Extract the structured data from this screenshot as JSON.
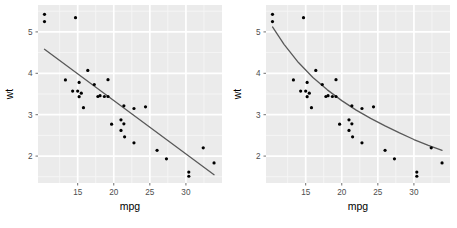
{
  "figure": {
    "type": "scatterplot-pair",
    "background_color": "#ffffff",
    "panel_background_color": "#ebebeb",
    "major_gridline_color": "#ffffff",
    "minor_gridline_color": "#f5f5f5",
    "point_color": "#000000",
    "fit_line_color": "#595959",
    "tick_text_color": "#4d4d4d",
    "axis_title_color": "#000000"
  },
  "panels": [
    {
      "name": "left-panel",
      "fit_type": "linear",
      "axis": {
        "xlabel": "mpg",
        "ylabel": "wt",
        "x_ticks": [
          "15",
          "20",
          "25",
          "30"
        ],
        "y_ticks": [
          "2",
          "3",
          "4",
          "5"
        ],
        "xlim": [
          9.5,
          35.0
        ],
        "ylim": [
          1.35,
          5.65
        ],
        "x_minor_ticks": [
          "12.5",
          "17.5",
          "22.5",
          "27.5",
          "32.5"
        ],
        "y_minor_ticks": [
          "1.5",
          "2.5",
          "3.5",
          "4.5",
          "5.5"
        ],
        "grid": true
      }
    },
    {
      "name": "right-panel",
      "fit_type": "curved",
      "axis": {
        "xlabel": "mpg",
        "ylabel": "wt",
        "x_ticks": [
          "15",
          "20",
          "25",
          "30"
        ],
        "y_ticks": [
          "2",
          "3",
          "4",
          "5"
        ],
        "xlim": [
          9.5,
          35.0
        ],
        "ylim": [
          1.35,
          5.65
        ],
        "x_minor_ticks": [
          "12.5",
          "17.5",
          "22.5",
          "27.5",
          "32.5"
        ],
        "y_minor_ticks": [
          "1.5",
          "2.5",
          "3.5",
          "4.5",
          "5.5"
        ],
        "grid": true
      }
    }
  ],
  "chart_data": [
    {
      "type": "scatter",
      "title": "",
      "xlabel": "mpg",
      "ylabel": "wt",
      "xlim": [
        9.5,
        35.0
      ],
      "ylim": [
        1.35,
        5.65
      ],
      "xticks": [
        15,
        20,
        25,
        30
      ],
      "yticks": [
        2,
        3,
        4,
        5
      ],
      "grid": true,
      "legend": "none",
      "series": [
        {
          "name": "mtcars",
          "marker": "filled-circle",
          "color": "#000000",
          "x": [
            21.0,
            21.0,
            22.8,
            21.4,
            18.7,
            18.1,
            14.3,
            24.4,
            22.8,
            19.2,
            17.8,
            16.4,
            17.3,
            15.2,
            10.4,
            10.4,
            14.7,
            32.4,
            30.4,
            33.9,
            21.5,
            15.5,
            15.2,
            13.3,
            19.2,
            27.3,
            26.0,
            30.4,
            15.8,
            19.7,
            15.0,
            21.4
          ],
          "y": [
            2.62,
            2.875,
            2.32,
            3.215,
            3.44,
            3.46,
            3.57,
            3.19,
            3.15,
            3.44,
            3.44,
            4.07,
            3.73,
            3.78,
            5.25,
            5.424,
            5.345,
            2.2,
            1.615,
            1.835,
            2.465,
            3.52,
            3.435,
            3.84,
            3.845,
            1.935,
            2.14,
            1.513,
            3.17,
            2.77,
            3.57,
            2.78
          ]
        }
      ],
      "fit": {
        "name": "linear-fit",
        "type": "line",
        "color": "#595959",
        "x": [
          10.4,
          33.9
        ],
        "y": [
          4.58,
          1.55
        ]
      }
    },
    {
      "type": "scatter",
      "title": "",
      "xlabel": "mpg",
      "ylabel": "wt",
      "xlim": [
        9.5,
        35.0
      ],
      "ylim": [
        1.35,
        5.65
      ],
      "xticks": [
        15,
        20,
        25,
        30
      ],
      "yticks": [
        2,
        3,
        4,
        5
      ],
      "grid": true,
      "legend": "none",
      "series": [
        {
          "name": "mtcars",
          "marker": "filled-circle",
          "color": "#000000",
          "x": [
            21.0,
            21.0,
            22.8,
            21.4,
            18.7,
            18.1,
            14.3,
            24.4,
            22.8,
            19.2,
            17.8,
            16.4,
            17.3,
            15.2,
            10.4,
            10.4,
            14.7,
            32.4,
            30.4,
            33.9,
            21.5,
            15.5,
            15.2,
            13.3,
            19.2,
            27.3,
            26.0,
            30.4,
            15.8,
            19.7,
            15.0,
            21.4
          ],
          "y": [
            2.62,
            2.875,
            2.32,
            3.215,
            3.44,
            3.46,
            3.57,
            3.19,
            3.15,
            3.44,
            3.44,
            4.07,
            3.73,
            3.78,
            5.25,
            5.424,
            5.345,
            2.2,
            1.615,
            1.835,
            2.465,
            3.52,
            3.435,
            3.84,
            3.845,
            1.935,
            2.14,
            1.513,
            3.17,
            2.77,
            3.57,
            2.78
          ]
        }
      ],
      "fit": {
        "name": "curved-fit",
        "type": "line",
        "color": "#595959",
        "x": [
          10.4,
          12.0,
          14.0,
          16.0,
          18.0,
          20.0,
          22.0,
          24.0,
          26.0,
          28.0,
          30.0,
          32.0,
          33.9
        ],
        "y": [
          5.12,
          4.7,
          4.26,
          3.9,
          3.6,
          3.34,
          3.11,
          2.91,
          2.73,
          2.56,
          2.4,
          2.26,
          2.14
        ]
      }
    }
  ]
}
